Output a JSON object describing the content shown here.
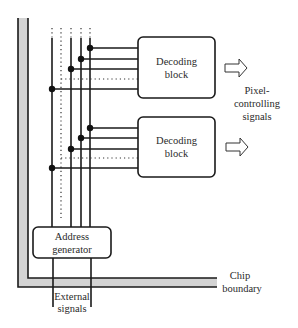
{
  "diagram": {
    "type": "chip-architecture-block-diagram",
    "blocks": {
      "decoder_1": {
        "line1": "Decoding",
        "line2": "block"
      },
      "decoder_2": {
        "line1": "Decoding",
        "line2": "block"
      },
      "address_generator": {
        "line1": "Address",
        "line2": "generator"
      }
    },
    "labels": {
      "output": {
        "line1": "Pixel-",
        "line2": "controlling",
        "line3": "signals"
      },
      "boundary": {
        "line1": "Chip",
        "line2": "boundary"
      },
      "input": {
        "line1": "External",
        "line2": "signals"
      }
    },
    "colors": {
      "line": "#1a1a1a",
      "boundary_fill": "#d3d3d3",
      "background": "#ffffff"
    }
  }
}
